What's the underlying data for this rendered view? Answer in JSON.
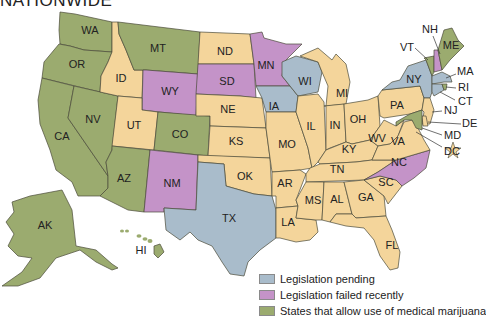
{
  "title": "NATIONWIDE",
  "colors": {
    "legal": "#9bab6f",
    "pending": "#a9bccb",
    "failed": "#c493c8",
    "none": "#f4d59b",
    "stroke": "#4a4a3a",
    "dc_star": "#f4d59b"
  },
  "legend": [
    {
      "key": "pending",
      "label": "Legislation pending",
      "color": "#a9bccb"
    },
    {
      "key": "failed",
      "label": "Legislation failed recently",
      "color": "#c493c8"
    },
    {
      "key": "legal",
      "label": "States that allow use of medical marijuana",
      "color": "#9bab6f"
    }
  ],
  "states": {
    "WA": {
      "label": "WA",
      "status": "legal"
    },
    "OR": {
      "label": "OR",
      "status": "legal"
    },
    "CA": {
      "label": "CA",
      "status": "legal"
    },
    "NV": {
      "label": "NV",
      "status": "legal"
    },
    "ID": {
      "label": "ID",
      "status": "none"
    },
    "MT": {
      "label": "MT",
      "status": "legal"
    },
    "WY": {
      "label": "WY",
      "status": "failed"
    },
    "UT": {
      "label": "UT",
      "status": "none"
    },
    "AZ": {
      "label": "AZ",
      "status": "legal"
    },
    "CO": {
      "label": "CO",
      "status": "legal"
    },
    "NM": {
      "label": "NM",
      "status": "failed"
    },
    "ND": {
      "label": "ND",
      "status": "none"
    },
    "SD": {
      "label": "SD",
      "status": "failed"
    },
    "NE": {
      "label": "NE",
      "status": "none"
    },
    "KS": {
      "label": "KS",
      "status": "none"
    },
    "OK": {
      "label": "OK",
      "status": "none"
    },
    "TX": {
      "label": "TX",
      "status": "pending"
    },
    "MN": {
      "label": "MN",
      "status": "failed"
    },
    "IA": {
      "label": "IA",
      "status": "pending"
    },
    "MO": {
      "label": "MO",
      "status": "none"
    },
    "AR": {
      "label": "AR",
      "status": "none"
    },
    "LA": {
      "label": "LA",
      "status": "none"
    },
    "WI": {
      "label": "WI",
      "status": "pending"
    },
    "IL": {
      "label": "IL",
      "status": "none"
    },
    "MI": {
      "label": "MI",
      "status": "none"
    },
    "IN": {
      "label": "IN",
      "status": "none"
    },
    "OH": {
      "label": "OH",
      "status": "none"
    },
    "KY": {
      "label": "KY",
      "status": "none"
    },
    "TN": {
      "label": "TN",
      "status": "none"
    },
    "MS": {
      "label": "MS",
      "status": "none"
    },
    "AL": {
      "label": "AL",
      "status": "none"
    },
    "GA": {
      "label": "GA",
      "status": "none"
    },
    "FL": {
      "label": "FL",
      "status": "none"
    },
    "SC": {
      "label": "SC",
      "status": "none"
    },
    "NC": {
      "label": "NC",
      "status": "failed"
    },
    "VA": {
      "label": "VA",
      "status": "none"
    },
    "WV": {
      "label": "WV",
      "status": "none"
    },
    "PA": {
      "label": "PA",
      "status": "none"
    },
    "NY": {
      "label": "NY",
      "status": "pending"
    },
    "VT": {
      "label": "VT",
      "status": "legal"
    },
    "NH": {
      "label": "NH",
      "status": "failed"
    },
    "ME": {
      "label": "ME",
      "status": "legal"
    },
    "MA": {
      "label": "MA",
      "status": "pending"
    },
    "RI": {
      "label": "RI",
      "status": "legal"
    },
    "CT": {
      "label": "CT",
      "status": "pending"
    },
    "NJ": {
      "label": "NJ",
      "status": "none"
    },
    "DE": {
      "label": "DE",
      "status": "none"
    },
    "MD": {
      "label": "MD",
      "status": "legal"
    },
    "DC": {
      "label": "DC",
      "status": "none"
    },
    "AK": {
      "label": "AK",
      "status": "legal"
    },
    "HI": {
      "label": "HI",
      "status": "legal"
    }
  }
}
